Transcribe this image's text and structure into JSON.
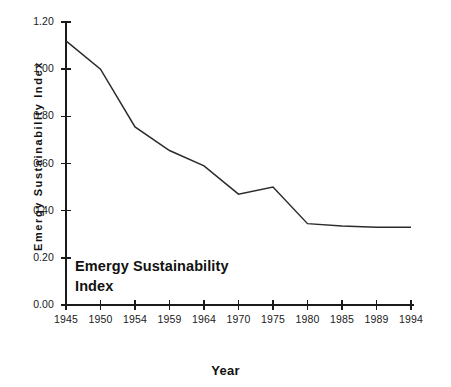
{
  "chart_data": {
    "type": "line",
    "title": "",
    "subtitle": "",
    "xlabel": "Year",
    "ylabel": "Emergy Sustainability Index",
    "annotation": "Emergy Sustainability Index",
    "annotation_lines": [
      "Emergy Sustainability",
      "Index"
    ],
    "grid": false,
    "legend": "none",
    "xlim": [
      1945,
      1994
    ],
    "ylim": [
      0.0,
      1.2
    ],
    "x_tick_labels": [
      "1945",
      "1950",
      "1954",
      "1959",
      "1964",
      "1970",
      "1975",
      "1980",
      "1985",
      "1989",
      "1994"
    ],
    "y_tick_labels": [
      "0.00",
      "0.20",
      "0.40",
      "0.60",
      "0.80",
      "1.00",
      "1.20"
    ],
    "y_tick_values": [
      0.0,
      0.2,
      0.4,
      0.6,
      0.8,
      1.0,
      1.2
    ],
    "categories": [
      1945,
      1950,
      1954,
      1959,
      1964,
      1970,
      1975,
      1980,
      1985,
      1989,
      1994
    ],
    "series": [
      {
        "name": "Emergy Sustainability Index",
        "color": "#2b2b2b",
        "values": [
          1.12,
          1.0,
          0.755,
          0.655,
          0.59,
          0.47,
          0.5,
          0.345,
          0.335,
          0.33,
          0.33
        ]
      }
    ]
  },
  "colors": {
    "line": "#2b2b2b",
    "axis": "#1a1a1a",
    "background": "#ffffff",
    "text": "#111111"
  }
}
